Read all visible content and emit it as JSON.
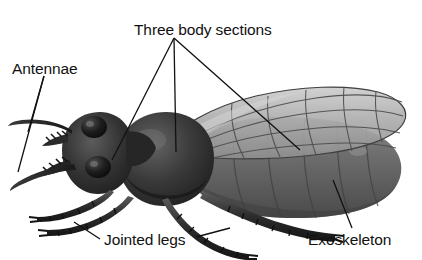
{
  "diagram": {
    "background_color": "#ffffff",
    "text_color": "#111111",
    "labels": {
      "three_body_sections": "Three body sections",
      "antennae": "Antennae",
      "jointed_legs": "Jointed legs",
      "exoskeleton": "Exoskeleton"
    },
    "parts": {
      "head": "head",
      "thorax": "thorax",
      "abdomen": "abdomen",
      "wing": "wing",
      "eye": "compound-eye",
      "mandible": "mandible",
      "antenna": "antenna",
      "leg": "jointed-leg"
    },
    "colors": {
      "body_dark": "#2e2e2e",
      "body_mid": "#555555",
      "abdomen": "#6a6a6a",
      "wing": "#a9a9a9",
      "wing_vein": "#4a4a4a",
      "leader_line": "#111111"
    },
    "leader_lines": {
      "three_body_sections_count": 3,
      "antennae_count": 2,
      "jointed_legs_count": 2,
      "exoskeleton_count": 1
    }
  }
}
